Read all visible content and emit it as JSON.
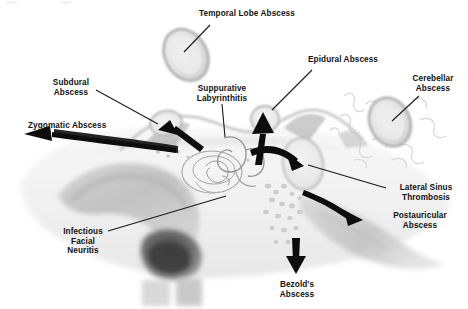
{
  "diagram": {
    "type": "medical-anatomical-illustration",
    "background_color": "#ffffff",
    "text_color": "#111111",
    "arrow_color": "#0d0d0d",
    "leader_line_color": "#1a1a1a",
    "illustration_style": "grayscale scanned coronal temporal bone section"
  },
  "labels": [
    {
      "id": "temporal-lobe-abscess",
      "text": "Temporal Lobe Abscess",
      "lines": [
        "Temporal Lobe Abscess"
      ],
      "align": "center",
      "x": 195,
      "y": 9,
      "width": 104
    },
    {
      "id": "subdural-abscess",
      "text": "Subdural\nAbscess",
      "lines": [
        "Subdural",
        "Abscess"
      ],
      "align": "center",
      "x": 40,
      "y": 78,
      "width": 62
    },
    {
      "id": "zygomatic-abscess",
      "text": "Zygomatic Abscess",
      "lines": [
        "Zygomatic Abscess"
      ],
      "align": "left",
      "x": 28,
      "y": 121,
      "width": 88
    },
    {
      "id": "suppurative-labyrinthitis",
      "text": "Suppurative\nLabyrinthitis",
      "lines": [
        "Suppurative",
        "Labyrinthitis"
      ],
      "align": "center",
      "x": 192,
      "y": 84,
      "width": 56
    },
    {
      "id": "epidural-abscess",
      "text": "Epidural Abscess",
      "lines": [
        "Epidural Abscess"
      ],
      "align": "left",
      "x": 308,
      "y": 55,
      "width": 86
    },
    {
      "id": "cerebellar-abscess",
      "text": "Cerebellar\nAbscess",
      "lines": [
        "Cerebellar",
        "Abscess"
      ],
      "align": "center",
      "x": 404,
      "y": 74,
      "width": 58
    },
    {
      "id": "lateral-sinus-thrombosis",
      "text": "Lateral Sinus\nThrombosis",
      "lines": [
        "Lateral Sinus",
        "Thrombosis"
      ],
      "align": "center",
      "x": 388,
      "y": 183,
      "width": 74
    },
    {
      "id": "postauricular-abscess",
      "text": "Postauricular\nAbscess",
      "lines": [
        "Postauricular",
        "Abscess"
      ],
      "align": "center",
      "x": 383,
      "y": 211,
      "width": 72
    },
    {
      "id": "infectious-facial-neuritis",
      "text": "Infectious\nFacial\nNeuritis",
      "lines": [
        "Infectious",
        "Facial",
        "Neuritis"
      ],
      "align": "center",
      "x": 55,
      "y": 227,
      "width": 56
    },
    {
      "id": "bezolds-abscess",
      "text": "Bezold's\nAbscess",
      "lines": [
        "Bezold's",
        "Abscess"
      ],
      "align": "center",
      "x": 268,
      "y": 280,
      "width": 58
    }
  ],
  "abscess_shapes": [
    {
      "id": "temporal-lobe-abscess-mass",
      "shape": "ellipse",
      "cx": 186,
      "cy": 55,
      "rx": 21,
      "ry": 27,
      "rotate": -28,
      "fill": "#e4e4e4",
      "stroke": "#a9a9a9"
    },
    {
      "id": "cerebellar-abscess-mass",
      "shape": "ellipse",
      "cx": 390,
      "cy": 122,
      "rx": 20,
      "ry": 25,
      "rotate": -24,
      "fill": "#e4e4e4",
      "stroke": "#a9a9a9"
    },
    {
      "id": "lateral-sinus-mass",
      "shape": "ellipse",
      "cx": 303,
      "cy": 164,
      "rx": 20,
      "ry": 26,
      "rotate": -10,
      "fill": "#e2e2e2",
      "stroke": "#b4b4b4"
    },
    {
      "id": "subdural-abscess-mass",
      "shape": "ellipse",
      "cx": 166,
      "cy": 123,
      "rx": 16,
      "ry": 12,
      "rotate": -12,
      "fill": "#e6e6e6",
      "stroke": "#b0b0b0"
    },
    {
      "id": "epidural-abscess-mass",
      "shape": "ellipse",
      "cx": 265,
      "cy": 119,
      "rx": 14,
      "ry": 13,
      "rotate": 0,
      "fill": "#e6e6e6",
      "stroke": "#b0b0b0"
    }
  ],
  "arrows": [
    {
      "id": "zygomatic-arrow",
      "style": "thick-curved",
      "from": [
        175,
        145
      ],
      "to": [
        32,
        133
      ],
      "direction": "left"
    },
    {
      "id": "subdural-arrow",
      "style": "thick-straight",
      "from": [
        196,
        150
      ],
      "to": [
        165,
        126
      ],
      "direction": "upper-left"
    },
    {
      "id": "epidural-arrow",
      "style": "thick-straight",
      "from": [
        258,
        162
      ],
      "to": [
        265,
        116
      ],
      "direction": "up"
    },
    {
      "id": "lateral-sinus-arrow",
      "style": "thick-curved",
      "from": [
        253,
        152
      ],
      "to": [
        300,
        163
      ],
      "direction": "right"
    },
    {
      "id": "postauricular-arrow",
      "style": "thick-curved",
      "from": [
        305,
        192
      ],
      "to": [
        364,
        216
      ],
      "direction": "lower-right"
    },
    {
      "id": "bezolds-arrow",
      "style": "thick-straight",
      "from": [
        296,
        240
      ],
      "to": [
        296,
        273
      ],
      "direction": "down"
    }
  ],
  "leader_lines": [
    {
      "id": "temporal-lobe-leader",
      "from": [
        210,
        25
      ],
      "to": [
        184,
        52
      ]
    },
    {
      "id": "subdural-leader",
      "from": [
        96,
        90
      ],
      "to": [
        158,
        124
      ]
    },
    {
      "id": "suppurative-leader",
      "from": [
        222,
        104
      ],
      "to": [
        224,
        135
      ]
    },
    {
      "id": "epidural-leader",
      "from": [
        312,
        70
      ],
      "to": [
        272,
        110
      ]
    },
    {
      "id": "cerebellar-leader",
      "from": [
        419,
        96
      ],
      "to": [
        392,
        121
      ]
    },
    {
      "id": "lateral-sinus-leader",
      "from": [
        386,
        188
      ],
      "to": [
        308,
        165
      ]
    },
    {
      "id": "facial-neuritis-leader",
      "from": [
        108,
        231
      ],
      "to": [
        226,
        196
      ]
    }
  ],
  "anatomy_regions": [
    {
      "id": "skull-base-field",
      "description": "pale gray scanned temporal bone section spanning the full width"
    },
    {
      "id": "mastoid-bone-band",
      "description": "mid gray curved band on the left, temporal squama / mastoid cortex"
    },
    {
      "id": "dark-muscle-blob",
      "description": "dark charcoal mass below the gray band, sternocleidomastoid insertion"
    },
    {
      "id": "cochlea-labyrinth",
      "description": "spiral outlined otic capsule in the center"
    },
    {
      "id": "mastoid-air-cells",
      "description": "stippled cell cluster right of center"
    },
    {
      "id": "dural-sinus-groove",
      "description": "gray tapering band running to the lower right"
    },
    {
      "id": "cerebellar-folia",
      "description": "faint line-work at right margin"
    }
  ]
}
